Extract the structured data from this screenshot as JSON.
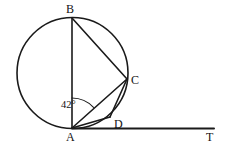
{
  "figure": {
    "type": "circle-geometry-diagram",
    "width": 228,
    "height": 150,
    "stroke_color": "#1a1a1a",
    "background_color": "#ffffff"
  },
  "circle": {
    "center_x": 72.5,
    "center_y": 73,
    "radius": 55.5
  },
  "points": {
    "A": {
      "label": "A",
      "x": 72,
      "y": 128
    },
    "B": {
      "label": "B",
      "x": 72,
      "y": 18
    },
    "C": {
      "label": "C",
      "x": 127,
      "y": 79
    },
    "D": {
      "label": "D",
      "x": 110,
      "y": 117
    },
    "T": {
      "label": "T",
      "x": 214,
      "y": 128
    }
  },
  "segments": [
    {
      "name": "AB",
      "from": "A",
      "to": "B"
    },
    {
      "name": "BC",
      "from": "B",
      "to": "C"
    },
    {
      "name": "AC",
      "from": "A",
      "to": "C"
    },
    {
      "name": "AD",
      "from": "A",
      "to": "D"
    },
    {
      "name": "CD",
      "from": "C",
      "to": "D"
    },
    {
      "name": "AT",
      "from": "A",
      "to": "T"
    }
  ],
  "angles": {
    "BAC": {
      "value": "42",
      "unit": "°",
      "label": "42°",
      "vertex": "A",
      "between": [
        "AB",
        "AC"
      ]
    }
  }
}
